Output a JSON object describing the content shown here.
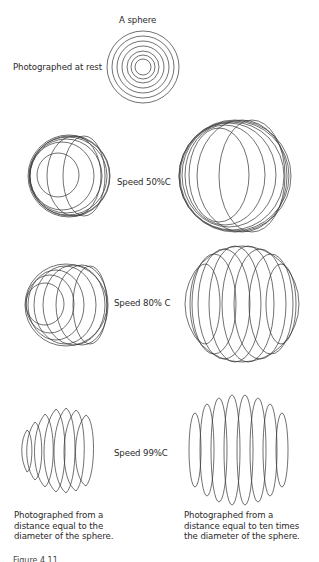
{
  "title": "A sphere",
  "rest_label": "Photographed at rest",
  "rows": [
    {
      "speed_label": "Speed 50%C"
    },
    {
      "speed_label": "Speed 80% C"
    },
    {
      "speed_label": "Speed 99%C"
    }
  ],
  "captions": {
    "left": "Photographed from a\ndistance equal to the\ndiameter of the sphere.",
    "right": "Photographed from a\ndistance equal to ten times\nthe diameter of the sphere."
  },
  "figure_label_partial": "Figure 4.11"
}
